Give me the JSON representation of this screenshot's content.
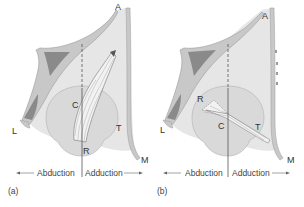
{
  "figure": {
    "panels": [
      {
        "id": "a",
        "panel_label": "(a)",
        "labels": {
          "A": "A",
          "C": "C",
          "R": "R",
          "T": "T",
          "L": "L",
          "M": "M"
        },
        "axis": {
          "left": "Abduction",
          "right": "Adduction"
        }
      },
      {
        "id": "b",
        "panel_label": "(b)",
        "labels": {
          "A": "A",
          "C": "C",
          "R": "R",
          "T": "T",
          "L": "L",
          "M": "M"
        },
        "axis": {
          "left": "Abduction",
          "right": "Adduction"
        }
      }
    ],
    "colors": {
      "bone": "#c8c8c8",
      "bone_edge": "#9a9a9a",
      "sinus": "#8a8a8a",
      "orbit_fill": "#e6e6e6",
      "globe": "#d9d9d9",
      "muscle": "#f2f2f2",
      "line": "#555555"
    }
  }
}
